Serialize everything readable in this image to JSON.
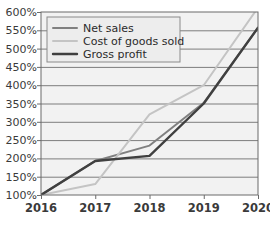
{
  "chart_data": {
    "type": "line",
    "title": "",
    "xlabel": "",
    "ylabel": "",
    "categories": [
      "2016",
      "2017",
      "2018",
      "2019",
      "2020"
    ],
    "x": [
      2016,
      2017,
      2018,
      2019,
      2020
    ],
    "ylim": [
      100,
      600
    ],
    "ytick_labels": [
      "100%",
      "150%",
      "200%",
      "250%",
      "300%",
      "350%",
      "400%",
      "450%",
      "500%",
      "550%",
      "600%"
    ],
    "ytick_values": [
      100,
      150,
      200,
      250,
      300,
      350,
      400,
      450,
      500,
      550,
      600
    ],
    "grid": true,
    "grid_axis": "y",
    "legend_position": "upper-left",
    "series": [
      {
        "name": "Net sales",
        "color": "#808080",
        "values": [
          100,
          193,
          235,
          352,
          557
        ]
      },
      {
        "name": "Cost of goods sold",
        "color": "#c4c4c4",
        "values": [
          100,
          130,
          320,
          400,
          612
        ]
      },
      {
        "name": "Gross profit",
        "color": "#404040",
        "values": [
          100,
          193,
          207,
          350,
          557
        ]
      }
    ]
  },
  "legend": {
    "entries": [
      {
        "label": "Net sales"
      },
      {
        "label": "Cost of goods sold"
      },
      {
        "label": "Gross profit"
      }
    ]
  },
  "axes": {
    "x_labels": [
      "2016",
      "2017",
      "2018",
      "2019",
      "2020"
    ],
    "y_labels": [
      "600%",
      "550%",
      "500%",
      "450%",
      "400%",
      "350%",
      "300%",
      "250%",
      "200%",
      "150%",
      "100%"
    ]
  },
  "colors": {
    "plot_background": "#f2f2f2",
    "grid_line": "#7d7d7d",
    "axis_line": "#6b6b6b",
    "legend_background": "#ededed",
    "legend_border": "#8a8a8a",
    "page_background": "#ffffff"
  }
}
